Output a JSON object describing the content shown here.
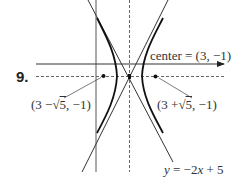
{
  "problem": {
    "number": "9."
  },
  "labels": {
    "center": "center = (3, −1)",
    "left_focus": {
      "prefix": "(3 −",
      "radical": "√",
      "radicand": "5",
      "suffix": ", −1)"
    },
    "right_focus": {
      "prefix": "(3 +",
      "radical": "√",
      "radicand": "5",
      "suffix": ", −1)"
    },
    "asymptote": {
      "var_y": "y",
      "eq": " = −2",
      "var_x": "x",
      "rest": " + 5"
    }
  },
  "diagram": {
    "type": "hyperbola",
    "center": [
      3,
      -1
    ],
    "foci": [
      [
        "3 - sqrt(5)",
        -1
      ],
      [
        "3 + sqrt(5)",
        -1
      ]
    ],
    "asymptote_labeled": "y = -2x + 5",
    "orientation": "horizontal transverse axis"
  },
  "colors": {
    "ink": "#222222",
    "text": "#333333",
    "background": "#ffffff"
  }
}
